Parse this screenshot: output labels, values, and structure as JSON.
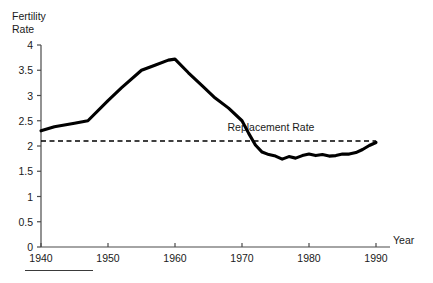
{
  "chart_data": {
    "type": "line",
    "title": "",
    "ylabel": "Fertility\nRate",
    "ylabel_line1": "Fertility",
    "ylabel_line2": "Rate",
    "xlabel": "Year",
    "grid": false,
    "legend": "none",
    "xlim": [
      1940,
      1990
    ],
    "ylim": [
      0,
      4
    ],
    "xticks": [
      1940,
      1950,
      1960,
      1970,
      1980,
      1990
    ],
    "xtick_labels": [
      "1940",
      "1950",
      "1960",
      "1970",
      "1980",
      "1990"
    ],
    "yticks": [
      0,
      0.5,
      1,
      1.5,
      2,
      2.5,
      3,
      3.5,
      4
    ],
    "ytick_labels": [
      "0",
      "0.5",
      "1",
      "1.5",
      "2",
      "2.5",
      "3",
      "3.5",
      "4"
    ],
    "annotations": [
      {
        "text": "Replacement Rate",
        "x": 1975,
        "y": 2.35
      }
    ],
    "series": [
      {
        "name": "Fertility Rate",
        "style": "solid",
        "color": "#000000",
        "x": [
          1940,
          1942,
          1945,
          1947,
          1950,
          1952,
          1955,
          1957,
          1959,
          1960,
          1962,
          1964,
          1966,
          1968,
          1970,
          1971,
          1972,
          1973,
          1974,
          1975,
          1976,
          1977,
          1978,
          1979,
          1980,
          1981,
          1982,
          1983,
          1984,
          1985,
          1986,
          1987,
          1988,
          1989,
          1990
        ],
        "y": [
          2.3,
          2.38,
          2.45,
          2.5,
          2.9,
          3.15,
          3.5,
          3.6,
          3.7,
          3.72,
          3.45,
          3.2,
          2.95,
          2.75,
          2.5,
          2.25,
          2.02,
          1.88,
          1.83,
          1.8,
          1.74,
          1.79,
          1.76,
          1.81,
          1.84,
          1.81,
          1.83,
          1.8,
          1.81,
          1.84,
          1.84,
          1.87,
          1.93,
          2.01,
          2.07
        ]
      },
      {
        "name": "Replacement Rate",
        "style": "dashed",
        "color": "#000000",
        "x": [
          1940,
          1990
        ],
        "y": [
          2.1,
          2.1
        ]
      }
    ]
  }
}
